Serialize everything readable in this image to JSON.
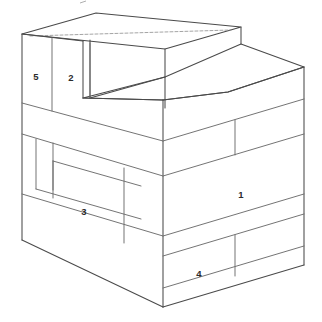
{
  "figure": {
    "background_color": "#ffffff",
    "line_color": "#4a4a4a",
    "label_color": "#2b2b2b",
    "canvas": {
      "width": 322,
      "height": 322
    }
  },
  "labels": [
    {
      "id": "label-1",
      "text": "1",
      "x": 241,
      "y": 195,
      "face": "right-front-face"
    },
    {
      "id": "label-2",
      "text": "2",
      "x": 71,
      "y": 78,
      "face": "left-upper-face"
    },
    {
      "id": "label-3",
      "text": "3",
      "x": 84,
      "y": 212,
      "face": "left-middle-face"
    },
    {
      "id": "label-4",
      "text": "4",
      "x": 199,
      "y": 274,
      "face": "right-bottom-face"
    },
    {
      "id": "label-5",
      "text": "5",
      "x": 36,
      "y": 77,
      "face": "left-upper-face"
    }
  ],
  "geometry": {
    "description": "Two-tier stepped isometric solid drawn with brick-course subdivisions",
    "outline": "22,34 96,13 241,27 304,67 304,265 164,307 22,240",
    "top_step_top_face": "22,34 96,13 241,27 165,49",
    "second_step_top_face": "83,98 165,49 241,27 304,67 228,92",
    "left_faces_count": 9,
    "right_faces_count": 8,
    "front_corner_x": 163,
    "left_back_edge_x": 22,
    "right_back_edge_x": 304
  },
  "edges": {
    "outline_polygon": [
      [
        22,
        34
      ],
      [
        96,
        13
      ],
      [
        241,
        27
      ],
      [
        304,
        67
      ],
      [
        304,
        265
      ],
      [
        164,
        307
      ],
      [
        22,
        240
      ]
    ],
    "top_face_upper_step": [
      [
        22,
        34
      ],
      [
        96,
        13
      ],
      [
        241,
        27
      ],
      [
        165,
        49
      ]
    ],
    "top_face_lower_step": [
      [
        83,
        98
      ],
      [
        165,
        49
      ],
      [
        241,
        27
      ],
      [
        304,
        67
      ],
      [
        228,
        92
      ]
    ],
    "vertical_front_corner": [
      [
        163,
        100
      ],
      [
        163,
        307
      ]
    ],
    "vertical_left_back": [
      [
        22,
        34
      ],
      [
        22,
        240
      ]
    ],
    "vertical_right_back": [
      [
        304,
        67
      ],
      [
        304,
        265
      ]
    ],
    "vertical_riser_left": [
      [
        83,
        41
      ],
      [
        83,
        98
      ]
    ],
    "vertical_riser_mid": [
      [
        90,
        40
      ],
      [
        90,
        98
      ]
    ],
    "left_face_course_lines": [
      [
        [
          22,
          98
        ],
        [
          163,
          141
        ]
      ],
      [
        [
          22,
          141
        ],
        [
          163,
          185
        ]
      ],
      [
        [
          22,
          185
        ],
        [
          163,
          228
        ]
      ],
      [
        [
          22,
          112
        ],
        [
          163,
          155
        ]
      ]
    ],
    "right_face_course_lines": [
      [
        [
          163,
          141
        ],
        [
          304,
          99
        ]
      ],
      [
        [
          163,
          185
        ],
        [
          304,
          142
        ]
      ],
      [
        [
          163,
          228
        ],
        [
          304,
          186
        ]
      ],
      [
        [
          163,
          256
        ],
        [
          304,
          213
        ]
      ]
    ],
    "left_face_vertical_splits": [
      [
        [
          50,
          107
        ],
        [
          50,
          193
        ]
      ],
      [
        [
          57,
          193
        ],
        [
          57,
          236
        ]
      ],
      [
        [
          124,
          127
        ],
        [
          124,
          213
        ]
      ],
      [
        [
          124,
          167
        ],
        [
          124,
          213
        ]
      ]
    ],
    "right_face_vertical_splits": [
      [
        [
          235,
          130
        ],
        [
          235,
          175
        ]
      ],
      [
        [
          235,
          243
        ],
        [
          235,
          288
        ]
      ]
    ]
  }
}
